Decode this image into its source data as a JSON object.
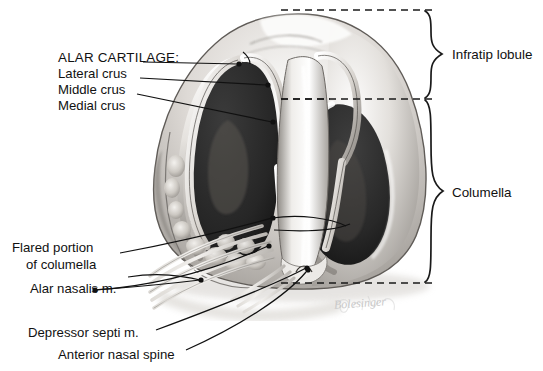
{
  "figure": {
    "type": "anatomical-illustration",
    "style": "grayscale pencil/airbrush medical illustration on white background",
    "signature": "Bolesinger"
  },
  "labels_left": {
    "heading": "ALAR CARTILAGE:",
    "items": [
      {
        "text": "Lateral crus",
        "x": 58,
        "y": 66
      },
      {
        "text": "Middle crus",
        "x": 58,
        "y": 82
      },
      {
        "text": "Medial crus",
        "x": 58,
        "y": 98
      }
    ]
  },
  "labels_lower_left": [
    {
      "text": "Flared portion",
      "x": 12,
      "y": 240
    },
    {
      "text": "of columella",
      "x": 26,
      "y": 257
    },
    {
      "text": "Alar nasalis m.",
      "x": 30,
      "y": 281
    },
    {
      "text": "Depressor septi m.",
      "x": 28,
      "y": 325
    },
    {
      "text": "Anterior nasal spine",
      "x": 58,
      "y": 347
    }
  ],
  "labels_right": [
    {
      "text": "Infratip lobule",
      "x": 452,
      "y": 47
    },
    {
      "text": "Columella",
      "x": 452,
      "y": 185
    }
  ],
  "brackets": [
    {
      "name": "infratip-lobule-brace",
      "top": 10,
      "bottom": 99,
      "tip_x": 443,
      "spine_x": 425
    },
    {
      "name": "columella-brace",
      "top": 99,
      "bottom": 283,
      "tip_x": 443,
      "spine_x": 425
    }
  ],
  "dashed_lines": [
    {
      "name": "top-dashed-line",
      "y": 10,
      "x1": 281,
      "x2": 432
    },
    {
      "name": "middle-dashed-line",
      "y": 99,
      "x1": 281,
      "x2": 432
    },
    {
      "name": "bottom-dashed-line",
      "y": 283,
      "x1": 281,
      "x2": 432
    }
  ],
  "colors": {
    "background": "#ffffff",
    "ink": "#111111",
    "nostril_dark": "#2e2e2e",
    "nostril_deep": "#1d1d1d",
    "tissue_light": "#e8e6e3",
    "tissue_mid": "#b9b5b0",
    "tissue_shadow": "#7e7a76",
    "signature_gray": "#c9c9c9"
  }
}
